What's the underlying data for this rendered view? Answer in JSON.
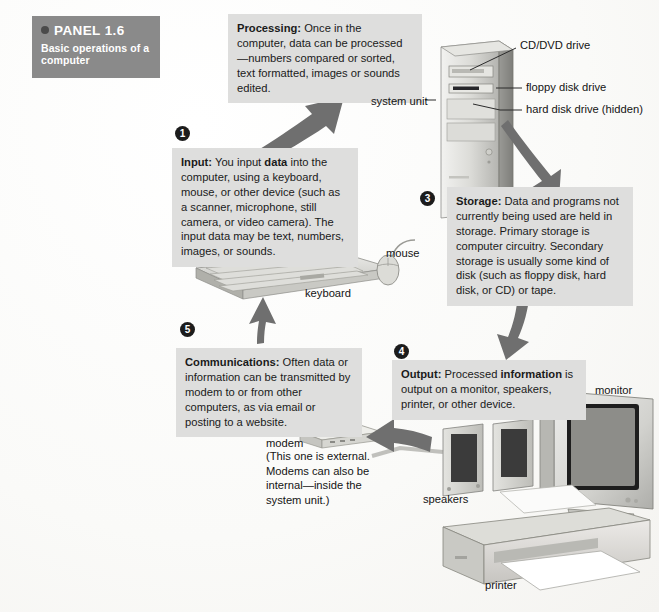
{
  "panel": {
    "label": "PANEL 1.6",
    "subtitle": "Basic operations of a computer",
    "bullet_icon": "bullet-dot-icon",
    "bg_color": "#8a8a8a",
    "text_color": "#ffffff"
  },
  "theme": {
    "callout_bg": "#dededd",
    "badge_bg": "#1c1c1c",
    "arrow_color": "#6f6f6f",
    "text_color": "#1a1a1a",
    "page_bg": "#fbfbf9"
  },
  "steps": [
    {
      "number": "1",
      "name": "input",
      "heading": "Input:",
      "body": " You input data into the computer, using a keyboard, mouse, or other device (such as a scanner, microphone, still camera, or video camera). The input data may be text, numbers, images, or sounds.",
      "bold_terms": [
        "data"
      ]
    },
    {
      "number": "2",
      "name": "processing",
      "heading": "Processing:",
      "body": " Once in the computer, data can be processed—numbers compared or sorted, text formatted, images or sounds edited.",
      "bold_terms": []
    },
    {
      "number": "3",
      "name": "storage",
      "heading": "Storage:",
      "body": " Data and programs not currently being used are held in storage. Primary storage is computer circuitry. Secondary storage is usually some kind of disk (such as floppy disk, hard disk, or CD) or tape.",
      "bold_terms": []
    },
    {
      "number": "4",
      "name": "output",
      "heading": "Output:",
      "body": " Processed information is output on a monitor, speakers, printer, or other device.",
      "bold_terms": [
        "information"
      ]
    },
    {
      "number": "5",
      "name": "communications",
      "heading": "Communications:",
      "body": " Often data or information can be transmitted by modem to or from other computers, as via email or posting to a website.",
      "bold_terms": []
    }
  ],
  "callouts": {
    "processing": {
      "heading": "Processing:",
      "text": " Once in the computer, data can be processed—numbers compared or sorted, text formatted, images or sounds edited."
    },
    "input": {
      "heading": "Input:",
      "text_1": " You input ",
      "bold_1": "data",
      "text_2": " into the computer, using a keyboard, mouse, or other device (such as a scanner, microphone, still camera, or video camera). The input data may be text, numbers, images, or sounds."
    },
    "storage": {
      "heading": "Storage:",
      "text": " Data and programs not currently being used are held in storage. Primary storage is computer circuitry. Secondary storage is usually some kind of disk (such as floppy disk, hard disk, or CD) or tape."
    },
    "output": {
      "heading": "Output:",
      "text_1": " Processed ",
      "bold_1": "information",
      "text_2": " is output on a monitor, speakers, printer, or other device."
    },
    "communications": {
      "heading": "Communications:",
      "text": " Often data or information can be transmitted by modem to or from other computers, as via email or posting to a website."
    }
  },
  "badges": {
    "one": "1",
    "three": "3",
    "four": "4",
    "five": "5"
  },
  "device_labels": {
    "system_unit": "system unit",
    "cd_dvd_drive": "CD/DVD drive",
    "floppy_disk_drive": "floppy disk drive",
    "hard_disk_drive": "hard disk drive (hidden)",
    "mouse": "mouse",
    "keyboard": "keyboard",
    "monitor": "monitor",
    "speakers": "speakers",
    "printer": "printer",
    "modem": "modem",
    "modem_note": "(This one is external. Modems can also be internal—inside the system unit.)"
  },
  "arrows": [
    {
      "name": "input-to-processing",
      "from": "input",
      "to": "processing",
      "direction": "up-right"
    },
    {
      "name": "processing-to-storage",
      "from": "system-unit",
      "to": "storage",
      "direction": "down-right"
    },
    {
      "name": "storage-to-output",
      "from": "storage",
      "to": "output",
      "direction": "down"
    },
    {
      "name": "output-to-communications",
      "from": "output",
      "to": "modem",
      "direction": "left"
    },
    {
      "name": "communications-to-input",
      "from": "communications",
      "to": "input",
      "direction": "up"
    }
  ]
}
